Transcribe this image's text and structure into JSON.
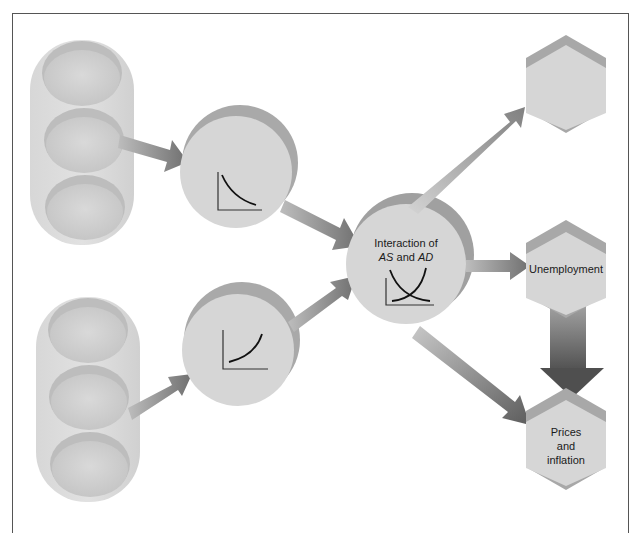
{
  "diagram": {
    "type": "macroeconomic flow diagram",
    "colors": {
      "shape_fill": "#d6d6d6",
      "shape_shadow": "#a9a9a9",
      "arrow_fill": "#8c8c8c",
      "arrow_dark": "#5e5e5e",
      "frame": "#555555",
      "curve": "#1a1a1a"
    },
    "inputs": [
      {
        "id": "top-input-group",
        "ovals": [
          "",
          "",
          ""
        ]
      },
      {
        "id": "bottom-input-group",
        "ovals": [
          "",
          "",
          ""
        ]
      }
    ],
    "curves": [
      {
        "id": "demand-curve-circle",
        "curve": "downward-sloping"
      },
      {
        "id": "supply-curve-circle",
        "curve": "upward-sloping"
      }
    ],
    "center": {
      "line1": "Interaction of",
      "as": "AS",
      "and": "and",
      "ad": "AD",
      "curve": "crossing curves"
    },
    "outputs": [
      {
        "id": "output-top",
        "label": ""
      },
      {
        "id": "output-unemployment",
        "label": "Unemployment"
      },
      {
        "id": "output-prices",
        "line1": "Prices",
        "line2": "and",
        "line3": "inflation"
      }
    ],
    "caption": "(caption cut off at bottom edge)"
  }
}
